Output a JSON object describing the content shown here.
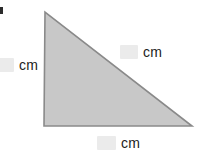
{
  "figure": {
    "shape_name": "right-triangle",
    "fill_color": "#c8c8c8",
    "stroke_color": "#8a8a8a",
    "background_color": "#ffffff",
    "vertices": {
      "top": [
        45,
        12
      ],
      "bottom_left": [
        44,
        126
      ],
      "bottom_right": [
        192,
        126
      ]
    },
    "points_attr": "45,12 44,126 192,126"
  },
  "labels": {
    "left_leg": {
      "value": "",
      "placeholder": "",
      "unit": "cm"
    },
    "hypotenuse": {
      "value": "",
      "placeholder": "",
      "unit": "cm"
    },
    "bottom_leg": {
      "value": "",
      "placeholder": "",
      "unit": "cm"
    }
  }
}
